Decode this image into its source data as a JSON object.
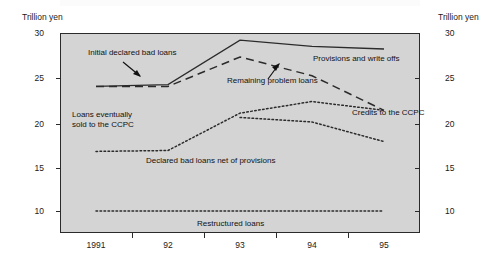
{
  "chart_data": {
    "type": "line",
    "title": "",
    "xlabel": "",
    "ylabel": "Trillion yen",
    "ylabel_right": "Trillion yen",
    "axis_unit_left": "Trillion yen",
    "axis_unit_right": "Trillion yen",
    "x": [
      "1991",
      "92",
      "93",
      "94",
      "95"
    ],
    "xticklabels": [
      "1991",
      "92",
      "93",
      "94",
      "95"
    ],
    "yticklabels": [
      "30",
      "25",
      "20",
      "15",
      "10"
    ],
    "ytickvalues": [
      30,
      25,
      20,
      15,
      10
    ],
    "ylim": [
      8,
      30
    ],
    "grid": false,
    "legend": "none (inline annotations)",
    "plot_background": "#d4d4d4",
    "series": [
      {
        "name": "Initial declared bad loans",
        "style": "solid",
        "values": [
          24.0,
          24.2,
          29.2,
          28.5,
          28.2
        ]
      },
      {
        "name": "Remaining problem loans",
        "style": "dashed",
        "values": [
          24.0,
          24.0,
          27.3,
          25.2,
          21.3
        ]
      },
      {
        "name": "Declared bad loans net of provisions",
        "style": "dotted",
        "values": [
          16.7,
          16.8,
          21.0,
          22.3,
          21.3
        ]
      },
      {
        "name": "Credits to the CCPC",
        "style": "dotted",
        "values": [
          null,
          null,
          20.5,
          20.0,
          17.8
        ]
      },
      {
        "name": "Restructured loans",
        "style": "dotted",
        "values": [
          10.0,
          10.0,
          10.0,
          10.0,
          10.0
        ]
      }
    ],
    "annotations": [
      {
        "text": "Initial declared bad loans",
        "target_series": "Initial declared bad loans",
        "arrow": true
      },
      {
        "text": "Provisions and write offs",
        "target_series": "gap between solid and dashed",
        "arrow": false
      },
      {
        "text": "Remaining problem loans",
        "target_series": "Remaining problem loans",
        "arrow": true
      },
      {
        "text": "Loans eventually\nsold to the CCPC",
        "target_series": "Credits to the CCPC",
        "arrow": false
      },
      {
        "text": "Declared bad loans net of provisions",
        "target_series": "Declared bad loans net of provisions",
        "arrow": false
      },
      {
        "text": "Credits to the CCPC",
        "target_series": "Credits to the CCPC",
        "arrow": false
      },
      {
        "text": "Restructured loans",
        "target_series": "Restructured loans",
        "arrow": false
      }
    ]
  },
  "colors": {
    "line": "#2b2b2b",
    "plot_bg": "#d4d4d4",
    "text": "#111111",
    "page_bg": "#ffffff"
  }
}
